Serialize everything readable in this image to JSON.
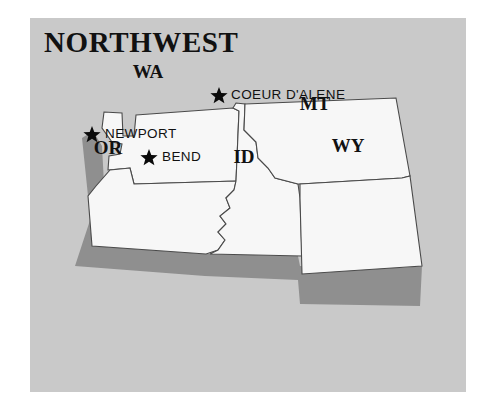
{
  "figure": {
    "title": "NORTHWEST",
    "panel_background": "#c9c9c9",
    "page_background": "#ffffff",
    "state_fill": "#f7f7f7",
    "state_stroke": "#4a4a4a",
    "shadow_color": "#8f8f8f",
    "label_color": "#111111"
  },
  "map": {
    "states": [
      {
        "code": "WA",
        "label": "WA",
        "label_x": 118,
        "label_y": 60
      },
      {
        "code": "OR",
        "label": "OR",
        "label_x": 78,
        "label_y": 136
      },
      {
        "code": "ID",
        "label": "ID",
        "label_x": 214,
        "label_y": 145
      },
      {
        "code": "MT",
        "label": "MT",
        "label_x": 285,
        "label_y": 92
      },
      {
        "code": "WY",
        "label": "WY",
        "label_x": 318,
        "label_y": 134
      }
    ],
    "cities": [
      {
        "name": "COEUR D'ALENE",
        "star_x": 189,
        "star_y": 76,
        "label_x": 201,
        "label_y": 81
      },
      {
        "name": "NEWPORT",
        "star_x": 62,
        "star_y": 115,
        "label_x": 75,
        "label_y": 120
      },
      {
        "name": "BEND",
        "star_x": 119,
        "star_y": 138,
        "label_x": 132,
        "label_y": 143
      }
    ],
    "marker_icon": "star-icon",
    "city_count": 3,
    "state_count": 5
  }
}
